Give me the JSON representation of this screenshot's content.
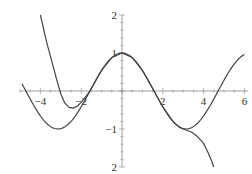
{
  "chart_data": {
    "type": "line",
    "title": "",
    "xlabel": "",
    "ylabel": "",
    "xlim": [
      -5,
      6
    ],
    "ylim": [
      -2,
      2
    ],
    "grid": false,
    "legend": null,
    "x_ticks": [
      -4,
      -2,
      2,
      4,
      6
    ],
    "x_tick_labels": [
      "-4",
      "-2",
      "2",
      "4",
      "6"
    ],
    "y_ticks": [
      2,
      1,
      -1,
      -2
    ],
    "y_tick_labels": [
      "2",
      "1",
      "-1",
      "2"
    ],
    "series": [
      {
        "name": "cos(x)",
        "color": "#444444",
        "function": "cos",
        "x_range": [
          -4.9,
          6.0
        ]
      },
      {
        "name": "polynomial approximation",
        "color": "#444444",
        "points": [
          [
            -4.0,
            2.0
          ],
          [
            -3.7,
            1.3
          ],
          [
            -3.5,
            0.9
          ],
          [
            -3.2,
            0.3
          ],
          [
            -3.0,
            -0.08
          ],
          [
            -2.8,
            -0.32
          ],
          [
            -2.6,
            -0.43
          ],
          [
            -2.4,
            -0.45
          ],
          [
            -2.2,
            -0.4
          ],
          [
            -2.0,
            -0.3
          ],
          [
            -1.57,
            0.0
          ],
          [
            -1.0,
            0.55
          ],
          [
            -0.5,
            0.88
          ],
          [
            0.0,
            1.0
          ],
          [
            0.5,
            0.88
          ],
          [
            1.0,
            0.54
          ],
          [
            1.57,
            0.0
          ],
          [
            2.0,
            -0.42
          ],
          [
            2.5,
            -0.8
          ],
          [
            2.8,
            -0.95
          ],
          [
            3.1,
            -1.02
          ],
          [
            3.4,
            -1.08
          ],
          [
            3.7,
            -1.2
          ],
          [
            4.0,
            -1.38
          ],
          [
            4.2,
            -1.6
          ],
          [
            4.4,
            -1.85
          ],
          [
            4.5,
            -2.0
          ]
        ]
      }
    ]
  },
  "axes": {
    "origin_px": [
      122,
      91
    ],
    "px_per_unit_x": 20.4,
    "px_per_unit_y": 38,
    "axis_color": "#888888",
    "curve_color": "#444444"
  }
}
